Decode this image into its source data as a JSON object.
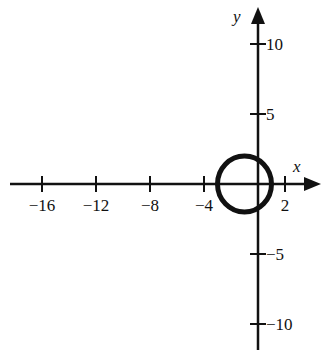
{
  "chart_data": {
    "type": "line",
    "title": "",
    "xlabel": "x",
    "ylabel": "y",
    "xlim": [
      -18,
      4.5
    ],
    "ylim": [
      -12,
      12.5
    ],
    "grid": false,
    "legend": null,
    "x_ticks": [
      -16,
      -12,
      -8,
      -4,
      2
    ],
    "x_tick_labels": [
      "−16",
      "−12",
      "−8",
      "−4",
      "2"
    ],
    "y_ticks": [
      10,
      5,
      -5,
      -10
    ],
    "y_tick_labels": [
      "10",
      "5",
      "−5",
      "−10"
    ],
    "series": [
      {
        "name": "circle",
        "shape": "circle",
        "center": [
          -1,
          0
        ],
        "radius": 2,
        "equation": "(x+1)^2 + y^2 = 4"
      }
    ]
  },
  "colors": {
    "ink": "#111111",
    "background": "#ffffff"
  }
}
